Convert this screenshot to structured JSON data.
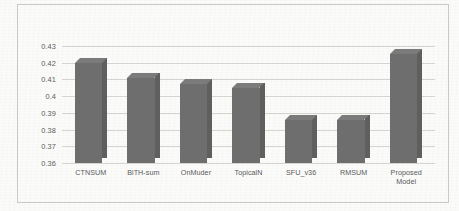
{
  "chart_data": {
    "type": "bar",
    "title": "",
    "xlabel": "",
    "ylabel": "",
    "categories": [
      "CTNSUM",
      "BiTH-sum",
      "OnMuder",
      "TopicalN",
      "SFU_v36",
      "RMSUM",
      "Proposed\nModel"
    ],
    "values": [
      0.42,
      0.411,
      0.407,
      0.405,
      0.386,
      0.386,
      0.425
    ],
    "ylim": [
      0.36,
      0.43
    ],
    "ytick_labels": [
      "0.43",
      "0.42",
      "0.41",
      "0.4",
      "0.39",
      "0.38",
      "0.37",
      "0.36"
    ],
    "ytick_values": [
      0.43,
      0.42,
      0.41,
      0.4,
      0.39,
      0.38,
      0.37,
      0.36
    ],
    "grid": true,
    "legend": "none",
    "bar_color": "#6e6e6e",
    "bar_top_color": "#7b7b7b",
    "bar_side_color": "#5f5f5f",
    "gridline_color": "#d2d2cf",
    "background_color": "#fbfbfa",
    "frame_color": "#c9c9c6",
    "style": "3d-column"
  }
}
